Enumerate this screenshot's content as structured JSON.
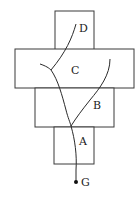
{
  "diagram": {
    "regions": [
      {
        "id": "D",
        "label": "D"
      },
      {
        "id": "C",
        "label": "C"
      },
      {
        "id": "B",
        "label": "B"
      },
      {
        "id": "A",
        "label": "A"
      }
    ],
    "point": {
      "id": "G",
      "label": "G"
    },
    "colors": {
      "stroke": "#2a2a2a",
      "background": "#ffffff"
    }
  }
}
